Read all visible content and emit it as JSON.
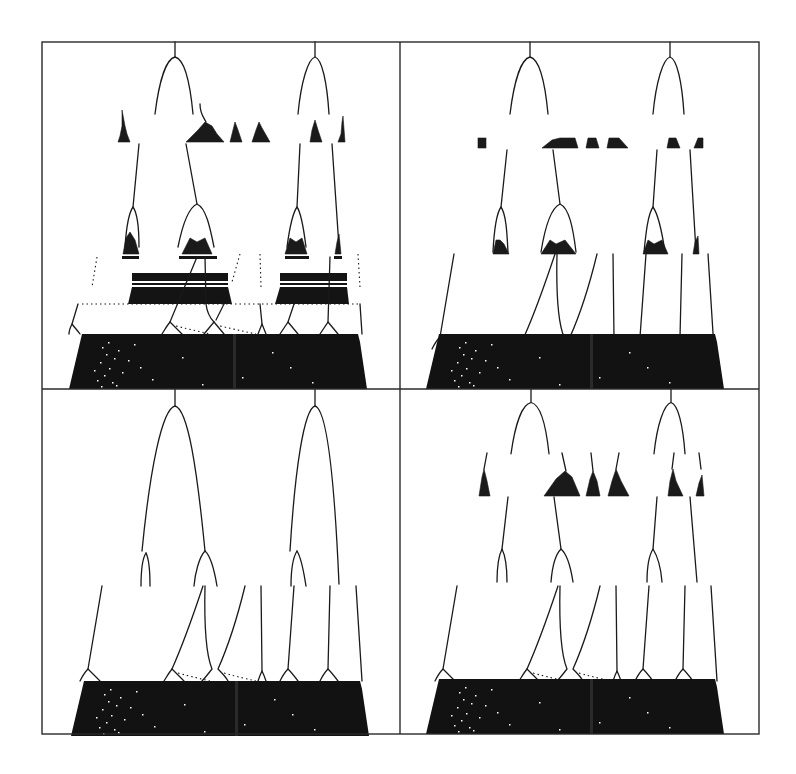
{
  "figure": {
    "type": "bifurcation-diagram-grid",
    "layout": {
      "rows": 2,
      "cols": 2
    },
    "frame": {
      "x": 42,
      "y": 42,
      "width": 717,
      "height": 692,
      "split_x": 400,
      "split_y": 389
    },
    "colors": {
      "ink": "#1a1a1a",
      "background": "#ffffff",
      "frame": "#2a2a2a"
    },
    "panels": [
      {
        "id": "top-left",
        "position": "row-1-col-1",
        "level2_islands": true,
        "level3_bands": true,
        "description": "Period-doubling cascade with dense chaotic islands at second level and banded chaotic windows at third level"
      },
      {
        "id": "top-right",
        "position": "row-1-col-2",
        "level2_islands": true,
        "level3_bands": false,
        "description": "Cascade with small chaotic islands at second level, branches continue to dense chaotic base"
      },
      {
        "id": "bottom-left",
        "position": "row-2-col-1",
        "level2_islands": false,
        "level3_bands": false,
        "description": "Clean cascade: two large parabolic branches splitting to smaller forks, then to the chaotic base"
      },
      {
        "id": "bottom-right",
        "position": "row-2-col-2",
        "level2_islands": true,
        "level3_bands": false,
        "description": "Cascade with second-level chaotic islands and third-level forks above chaotic base"
      }
    ],
    "text_labels": []
  }
}
